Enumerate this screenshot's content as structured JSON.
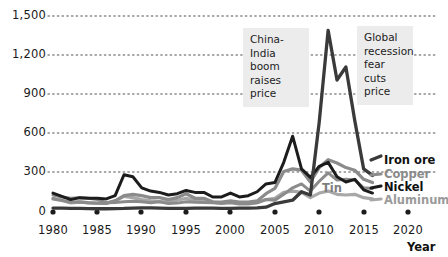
{
  "chart_data": {
    "type": "line",
    "title": "",
    "subtitle": "",
    "xlabel": "Year",
    "ylabel": "",
    "xlim": [
      1980,
      2021
    ],
    "ylim": [
      0,
      1550
    ],
    "grid": true,
    "grid_style": "dotted-horizontal",
    "legend_position": "right-inline",
    "x_tick_labels": [
      "1980",
      "1985",
      "1990",
      "1995",
      "2000",
      "2005",
      "2010",
      "2015",
      "2020"
    ],
    "x_ticks": [
      1980,
      1985,
      1990,
      1995,
      2000,
      2005,
      2010,
      2015,
      2020
    ],
    "y_tick_labels": [
      "0",
      "300",
      "600",
      "900",
      "1,200",
      "1,500"
    ],
    "y_ticks": [
      0,
      300,
      600,
      900,
      1200,
      1500
    ],
    "x": [
      1980,
      1981,
      1982,
      1983,
      1984,
      1985,
      1986,
      1987,
      1988,
      1989,
      1990,
      1991,
      1992,
      1993,
      1994,
      1995,
      1996,
      1997,
      1998,
      1999,
      2000,
      2001,
      2002,
      2003,
      2004,
      2005,
      2006,
      2007,
      2008,
      2009,
      2010,
      2011,
      2012,
      2013,
      2014,
      2015,
      2016
    ],
    "series": [
      {
        "name": "Iron ore",
        "color": "#3a3a3a",
        "values": [
          30,
          30,
          28,
          27,
          26,
          25,
          25,
          26,
          27,
          30,
          32,
          32,
          30,
          28,
          27,
          28,
          29,
          30,
          30,
          28,
          28,
          30,
          30,
          32,
          37,
          65,
          77,
          90,
          155,
          130,
          690,
          1390,
          1010,
          1110,
          700,
          330,
          280
        ]
      },
      {
        "name": "Copper",
        "color": "#8b8b8b",
        "values": [
          100,
          88,
          75,
          78,
          70,
          67,
          65,
          85,
          125,
          135,
          125,
          110,
          110,
          95,
          110,
          140,
          105,
          105,
          78,
          75,
          85,
          75,
          75,
          85,
          140,
          180,
          310,
          330,
          320,
          230,
          340,
          400,
          375,
          340,
          320,
          250,
          225
        ]
      },
      {
        "name": "Nickel",
        "color": "#1c1c1c",
        "values": [
          145,
          120,
          95,
          110,
          105,
          105,
          100,
          125,
          285,
          270,
          185,
          160,
          150,
          130,
          140,
          165,
          150,
          150,
          115,
          115,
          145,
          115,
          125,
          155,
          215,
          225,
          380,
          580,
          330,
          265,
          350,
          380,
          270,
          230,
          250,
          170,
          145
        ]
      },
      {
        "name": "Aluminum",
        "color": "#a8a8a8",
        "values": [
          105,
          90,
          70,
          75,
          72,
          68,
          70,
          85,
          120,
          110,
          95,
          85,
          80,
          75,
          90,
          105,
          85,
          85,
          75,
          70,
          78,
          68,
          68,
          72,
          95,
          105,
          150,
          160,
          150,
          110,
          145,
          160,
          135,
          130,
          135,
          110,
          100
        ]
      },
      {
        "name": "Tin",
        "color": "#8b8b8b",
        "values": [
          130,
          115,
          105,
          110,
          105,
          95,
          70,
          72,
          78,
          82,
          78,
          70,
          78,
          65,
          68,
          78,
          75,
          72,
          70,
          65,
          70,
          62,
          62,
          70,
          95,
          90,
          135,
          185,
          215,
          160,
          235,
          300,
          245,
          250,
          245,
          185,
          180
        ]
      }
    ],
    "inline_labels": [
      {
        "name": "Tin",
        "text": "Tin"
      }
    ],
    "annotations": [
      {
        "name": "china-india-boom",
        "text": "China-India boom raises price",
        "lines": [
          "China-India",
          "boom raises",
          "price"
        ]
      },
      {
        "name": "global-recession",
        "text": "Global recession fear cuts price",
        "lines": [
          "Global",
          "recession",
          "fear cuts",
          "price"
        ]
      }
    ],
    "legend_entries": [
      {
        "label": "Iron ore",
        "color": "#111111"
      },
      {
        "label": "Copper",
        "color": "#8b8b8b"
      },
      {
        "label": "Nickel",
        "color": "#111111"
      },
      {
        "label": "Aluminum",
        "color": "#9a9a9a"
      }
    ]
  },
  "colors": {
    "background": "#ffffff",
    "grid": "#8a8a8a",
    "annotation_bg": "#ececec",
    "text": "#1a1a1a"
  }
}
